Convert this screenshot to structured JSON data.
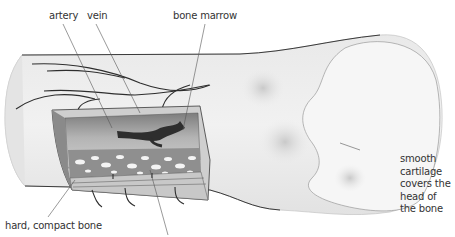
{
  "diagram": {
    "labels": {
      "artery": "artery",
      "vein": "vein",
      "bone_marrow": "bone marrow",
      "cartilage_lines": [
        "smooth",
        "cartilage",
        "covers the",
        "head of",
        "the bone"
      ],
      "compact_bone": "hard, compact bone"
    },
    "colors": {
      "bone_surface": "#ececec",
      "bone_shadow": "#d6d6d6",
      "outline": "#3a3a3a",
      "marrow_cavity": "#a9a9a9",
      "spongy_bone": "#8f8f8f",
      "spongy_holes": "#f4f4f4",
      "compact_section": "#bdbdbd",
      "blood_vessel": "#2e2e2e",
      "leader_line": "#555555",
      "text": "#333333"
    }
  }
}
